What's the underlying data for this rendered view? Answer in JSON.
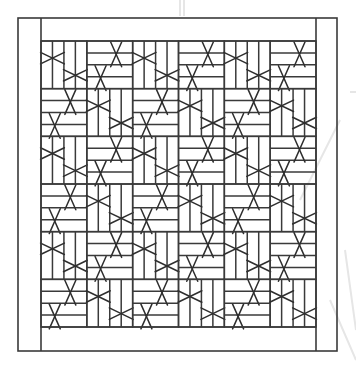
{
  "diagram": {
    "canvas": {
      "width": 356,
      "height": 369,
      "background": "#ffffff"
    },
    "colors": {
      "line": "#3a3a3a",
      "diagonal": "#2e2e2e",
      "watermark": "#e6e6e6"
    },
    "frame": {
      "outer": {
        "x": 18,
        "y": 18,
        "width": 319,
        "height": 333
      },
      "left_stile_inner_x": 41,
      "right_stile_inner_x": 316,
      "top_rail_inner_y": 41,
      "bottom_rail_inner_y": 327
    },
    "lattice": {
      "x": 41,
      "y": 41,
      "width": 275,
      "height": 286,
      "columns": 6,
      "rows": 6,
      "slats_per_block": 4,
      "pattern": [
        [
          "V",
          "H",
          "V",
          "H",
          "V",
          "H"
        ],
        [
          "H",
          "V",
          "H",
          "V",
          "H",
          "V"
        ],
        [
          "V",
          "H",
          "V",
          "H",
          "V",
          "H"
        ],
        [
          "H",
          "V",
          "H",
          "V",
          "H",
          "V"
        ],
        [
          "V",
          "H",
          "V",
          "H",
          "V",
          "H"
        ],
        [
          "H",
          "V",
          "H",
          "V",
          "H",
          "V"
        ]
      ],
      "crossings": {
        "V": [
          {
            "cx": 0.25,
            "cy": 0.36
          },
          {
            "cx": 0.75,
            "cy": 0.72
          }
        ],
        "H": [
          {
            "cx": 0.64,
            "cy": 0.28
          },
          {
            "cx": 0.3,
            "cy": 0.78
          }
        ]
      }
    }
  }
}
